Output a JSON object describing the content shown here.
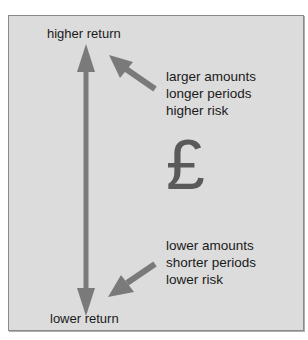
{
  "diagram": {
    "top_label": "higher return",
    "bottom_label": "lower return",
    "upper_factors": [
      "larger amounts",
      "longer periods",
      "higher risk"
    ],
    "lower_factors": [
      "lower amounts",
      "shorter periods",
      "lower risk"
    ],
    "currency_symbol": "£",
    "colors": {
      "panel_background": "#dcdcdc",
      "panel_border": "#8a8a8a",
      "arrow": "#7a7a7a",
      "symbol": "#5a5a5a",
      "text": "#1a1a1a"
    }
  }
}
